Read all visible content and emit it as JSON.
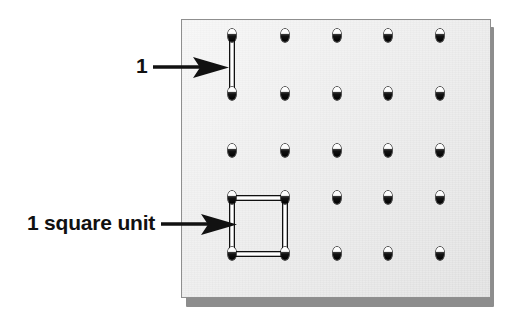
{
  "figure": {
    "kind": "geoboard-diagram",
    "title": "Geoboard with unit length and unit square",
    "background_color": "#ffffff"
  },
  "board": {
    "name": "geoboard",
    "face_color": "#eeeeee",
    "border_color": "#8f8f8f",
    "edge_shadow_color": "#8d8d8d",
    "rows": 5,
    "columns": 5,
    "peg_color_top": "#ffffff",
    "peg_color_bottom": "#000000",
    "peg_positions": [
      {
        "row": 1,
        "col": 1,
        "x": 51,
        "y": 17
      },
      {
        "row": 1,
        "col": 2,
        "x": 104,
        "y": 17
      },
      {
        "row": 1,
        "col": 3,
        "x": 156,
        "y": 17
      },
      {
        "row": 1,
        "col": 4,
        "x": 207,
        "y": 17
      },
      {
        "row": 1,
        "col": 5,
        "x": 259,
        "y": 17
      },
      {
        "row": 2,
        "col": 1,
        "x": 51,
        "y": 75
      },
      {
        "row": 2,
        "col": 2,
        "x": 104,
        "y": 75
      },
      {
        "row": 2,
        "col": 3,
        "x": 156,
        "y": 75
      },
      {
        "row": 2,
        "col": 4,
        "x": 207,
        "y": 75
      },
      {
        "row": 2,
        "col": 5,
        "x": 259,
        "y": 75
      },
      {
        "row": 3,
        "col": 1,
        "x": 51,
        "y": 132
      },
      {
        "row": 3,
        "col": 2,
        "x": 104,
        "y": 132
      },
      {
        "row": 3,
        "col": 3,
        "x": 156,
        "y": 132
      },
      {
        "row": 3,
        "col": 4,
        "x": 207,
        "y": 132
      },
      {
        "row": 3,
        "col": 5,
        "x": 259,
        "y": 132
      },
      {
        "row": 4,
        "col": 1,
        "x": 51,
        "y": 179
      },
      {
        "row": 4,
        "col": 2,
        "x": 104,
        "y": 179
      },
      {
        "row": 4,
        "col": 3,
        "x": 156,
        "y": 179
      },
      {
        "row": 4,
        "col": 4,
        "x": 207,
        "y": 179
      },
      {
        "row": 4,
        "col": 5,
        "x": 259,
        "y": 179
      },
      {
        "row": 5,
        "col": 1,
        "x": 51,
        "y": 235
      },
      {
        "row": 5,
        "col": 2,
        "x": 104,
        "y": 235
      },
      {
        "row": 5,
        "col": 3,
        "x": 156,
        "y": 235
      },
      {
        "row": 5,
        "col": 4,
        "x": 207,
        "y": 235
      },
      {
        "row": 5,
        "col": 5,
        "x": 259,
        "y": 235
      }
    ]
  },
  "bands": [
    {
      "id": "unit-length-band",
      "shape": "segment",
      "description": "vertical rubber band spanning one unit of length",
      "points": [
        {
          "x": 51,
          "y": 17
        },
        {
          "x": 51,
          "y": 75
        }
      ],
      "stroke_color": "#111111",
      "fill_color": "#ffffff"
    },
    {
      "id": "unit-square-band",
      "shape": "square",
      "description": "rubber band square enclosing one square unit of area",
      "points": [
        {
          "x": 51,
          "y": 179
        },
        {
          "x": 104,
          "y": 179
        },
        {
          "x": 104,
          "y": 235
        },
        {
          "x": 51,
          "y": 235
        }
      ],
      "stroke_color": "#111111",
      "fill_color": "#ffffff"
    }
  ],
  "annotations": [
    {
      "id": "unit-length",
      "label": "1",
      "points_to": "unit-length-band",
      "arrow_direction": "right",
      "text_color": "#111111"
    },
    {
      "id": "unit-area",
      "label": "1 square unit",
      "points_to": "unit-square-band",
      "arrow_direction": "right",
      "text_color": "#111111"
    }
  ]
}
